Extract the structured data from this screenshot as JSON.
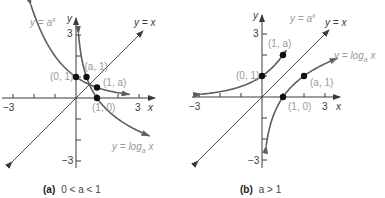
{
  "panels": [
    {
      "id": "a",
      "caption_tag": "(a)",
      "caption_text": "0 < a < 1",
      "x_axis_label": "x",
      "y_axis_label": "y",
      "x_ticks": {
        "min": "−3",
        "max": "3"
      },
      "y_ticks": {
        "max": "3",
        "min": "−3"
      },
      "curves": {
        "exp": "y = a",
        "exp_sup": "x",
        "log": "y = log",
        "log_sub": "a",
        "log_var": " x",
        "identity": "y = x"
      },
      "a_value": 0.5,
      "points": [
        {
          "label": "(0, 1)",
          "x": 0,
          "y": 1
        },
        {
          "label": "(a, 1)",
          "x": 0.5,
          "y": 1
        },
        {
          "label": "(1, a)",
          "x": 1,
          "y": 0.5
        },
        {
          "label": "(1, 0)",
          "x": 1,
          "y": 0
        }
      ]
    },
    {
      "id": "b",
      "caption_tag": "(b)",
      "caption_text": "a > 1",
      "x_axis_label": "x",
      "y_axis_label": "y",
      "x_ticks": {
        "min": "−3",
        "max": "3"
      },
      "y_ticks": {
        "max": "3",
        "min": "−3"
      },
      "curves": {
        "exp": "y = a",
        "exp_sup": "x",
        "log": "y = log",
        "log_sub": "a",
        "log_var": " x",
        "identity": "y = x"
      },
      "a_value": 2,
      "points": [
        {
          "label": "(0, 1)",
          "x": 0,
          "y": 1
        },
        {
          "label": "(1, a)",
          "x": 1,
          "y": 2
        },
        {
          "label": "(a, 1)",
          "x": 2,
          "y": 1
        },
        {
          "label": "(1, 0)",
          "x": 1,
          "y": 0
        }
      ]
    }
  ]
}
